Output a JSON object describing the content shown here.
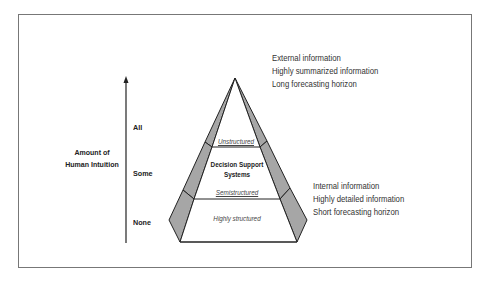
{
  "axis": {
    "title_line1": "Amount of",
    "title_line2": "Human Intuition",
    "levels": [
      "All",
      "Some",
      "None"
    ]
  },
  "pyramid": {
    "bands": {
      "top": "Unstructured",
      "middle_title_line1": "Decision Support",
      "middle_title_line2": "Systems",
      "semi": "Semistructured",
      "bottom": "Highly structured"
    },
    "colors": {
      "side_fill": "#a6a6a6",
      "stroke": "#222222",
      "face_fill": "#ffffff"
    }
  },
  "annotations": {
    "top": [
      "External information",
      "Highly summarized information",
      "Long forecasting horizon"
    ],
    "bottom": [
      "Internal information",
      "Highly detailed information",
      "Short forecasting horizon"
    ]
  }
}
